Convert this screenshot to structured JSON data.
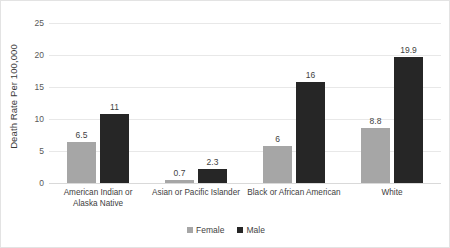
{
  "chart_data": {
    "type": "bar",
    "title": "",
    "xlabel": "",
    "ylabel": "Death Rate Per 100,000",
    "ylim": [
      0,
      25
    ],
    "yticks": [
      0,
      5,
      10,
      15,
      20,
      25
    ],
    "grid": true,
    "legend_position": "bottom-center",
    "categories": [
      "American Indian or Alaska Native",
      "Asian or Pacific Islander",
      "Black or African American",
      "White"
    ],
    "series": [
      {
        "name": "Female",
        "color": "#a6a6a6",
        "values": [
          6.5,
          0.7,
          6,
          8.8
        ],
        "labels": [
          "6.5",
          "0.7",
          "6",
          "8.8"
        ]
      },
      {
        "name": "Male",
        "color": "#262626",
        "values": [
          11,
          2.3,
          16,
          19.9
        ],
        "labels": [
          "11",
          "2.3",
          "16",
          "19.9"
        ]
      }
    ]
  },
  "yticks_text": [
    "25",
    "20",
    "15",
    "10",
    "5",
    "0"
  ]
}
